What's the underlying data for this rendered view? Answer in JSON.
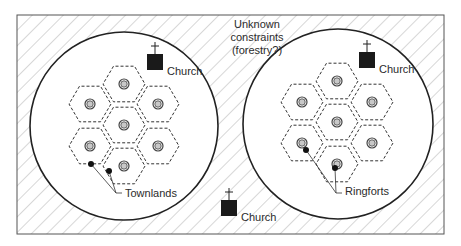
{
  "diagram": {
    "colors": {
      "background": "#ffffff",
      "hatch": "#9a9a9a",
      "frame": "#555555",
      "circle": "#222222",
      "hex": "#333333",
      "church": "#1a1a1a",
      "ringfort_outer": "#444444",
      "ringfort_fill": "#c8c8c8",
      "townland_dot": "#111111"
    },
    "unknown_constraints": {
      "lines": [
        "Unknown",
        "constraints",
        "(forestry?)"
      ]
    },
    "clusters": [
      {
        "id": "left",
        "circle": {
          "cx": 124,
          "cy": 126,
          "r": 94
        },
        "hex_radius": 21,
        "ringforts": [
          {
            "x": 124,
            "y": 84
          },
          {
            "x": 90,
            "y": 104
          },
          {
            "x": 158,
            "y": 104
          },
          {
            "x": 124,
            "y": 125
          },
          {
            "x": 90,
            "y": 146
          },
          {
            "x": 158,
            "y": 146
          },
          {
            "x": 124,
            "y": 166
          }
        ],
        "church": {
          "x": 147,
          "y": 54,
          "label": "Church"
        },
        "markers": [
          {
            "x": 91,
            "y": 164
          },
          {
            "x": 109,
            "y": 171
          }
        ],
        "callout": {
          "label": "Townlands",
          "x": 125,
          "y": 197,
          "join_x": 116,
          "join_y": 193
        }
      },
      {
        "id": "right",
        "circle": {
          "cx": 338,
          "cy": 124,
          "r": 95
        },
        "hex_radius": 21,
        "ringforts": [
          {
            "x": 337,
            "y": 81
          },
          {
            "x": 302,
            "y": 102
          },
          {
            "x": 372,
            "y": 102
          },
          {
            "x": 337,
            "y": 122
          },
          {
            "x": 302,
            "y": 143
          },
          {
            "x": 372,
            "y": 143
          },
          {
            "x": 337,
            "y": 164
          }
        ],
        "church": {
          "x": 359,
          "y": 52,
          "label": "Church"
        },
        "markers": [
          {
            "x": 306,
            "y": 150
          },
          {
            "x": 335,
            "y": 168
          }
        ],
        "callout": {
          "label": "Ringforts",
          "x": 345,
          "y": 195,
          "join_x": 336,
          "join_y": 193
        }
      }
    ],
    "central_church": {
      "x": 221,
      "y": 200,
      "label": "Church"
    }
  }
}
